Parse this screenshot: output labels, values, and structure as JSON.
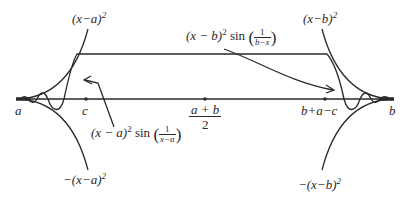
{
  "figure": {
    "type": "diagram",
    "colors": {
      "stroke": "#2a2a2a",
      "background": "#ffffff"
    }
  },
  "axis": {
    "points": [
      {
        "id": "a",
        "label": "a"
      },
      {
        "id": "c",
        "label": "c"
      },
      {
        "id": "mid",
        "label_num": "a + b",
        "label_den": "2"
      },
      {
        "id": "bac",
        "label": "b+a−c"
      },
      {
        "id": "b",
        "label": "b"
      }
    ]
  },
  "labels": {
    "upper_left_envelope": {
      "base": "(x−a)",
      "exp": "2"
    },
    "upper_right_envelope": {
      "base": "(x−b)",
      "exp": "2"
    },
    "lower_left_envelope": {
      "base": "−(x−a)",
      "exp": "2"
    },
    "lower_right_envelope": {
      "base": "−(x−b)",
      "exp": "2"
    },
    "left_function": {
      "base": "(x − a)",
      "exp": "2",
      "fn": "sin",
      "num": "1",
      "den": "x−a"
    },
    "right_function": {
      "base": "(x − b)",
      "exp": "2",
      "fn": "sin",
      "num": "1",
      "den": "b−x"
    }
  }
}
